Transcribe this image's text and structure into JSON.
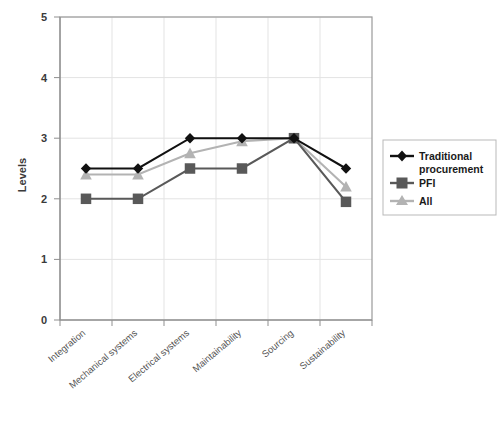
{
  "chart_data": {
    "type": "line",
    "title": "",
    "xlabel": "",
    "ylabel": "Levels",
    "ylim": [
      0,
      5
    ],
    "yticks": [
      0,
      1,
      2,
      3,
      4,
      5
    ],
    "grid": true,
    "legend_position": "right",
    "categories": [
      "Integration",
      "Mechanical systems",
      "Electrical systems",
      "Maintainability",
      "Sourcing",
      "Sustainability"
    ],
    "series": [
      {
        "name": "Traditional procurement",
        "color": "#111111",
        "marker": "diamond",
        "values": [
          2.5,
          2.5,
          3.0,
          3.0,
          3.0,
          2.5
        ]
      },
      {
        "name": "PFI",
        "color": "#595959",
        "marker": "square",
        "values": [
          2.0,
          2.0,
          2.5,
          2.5,
          3.0,
          1.95
        ]
      },
      {
        "name": "All",
        "color": "#b3b3b3",
        "marker": "triangle",
        "values": [
          2.4,
          2.4,
          2.75,
          2.95,
          3.0,
          2.2
        ]
      }
    ]
  },
  "axes": {
    "y_title": "Levels",
    "y_tick_labels": [
      "5",
      "4",
      "3",
      "2",
      "1",
      "0"
    ]
  },
  "legend": {
    "entries": [
      {
        "label_line1": "Traditional",
        "label_line2": "procurement",
        "marker": "diamond-icon"
      },
      {
        "label_line1": "PFI",
        "label_line2": "",
        "marker": "square-icon"
      },
      {
        "label_line1": "All",
        "label_line2": "",
        "marker": "triangle-icon"
      }
    ]
  }
}
